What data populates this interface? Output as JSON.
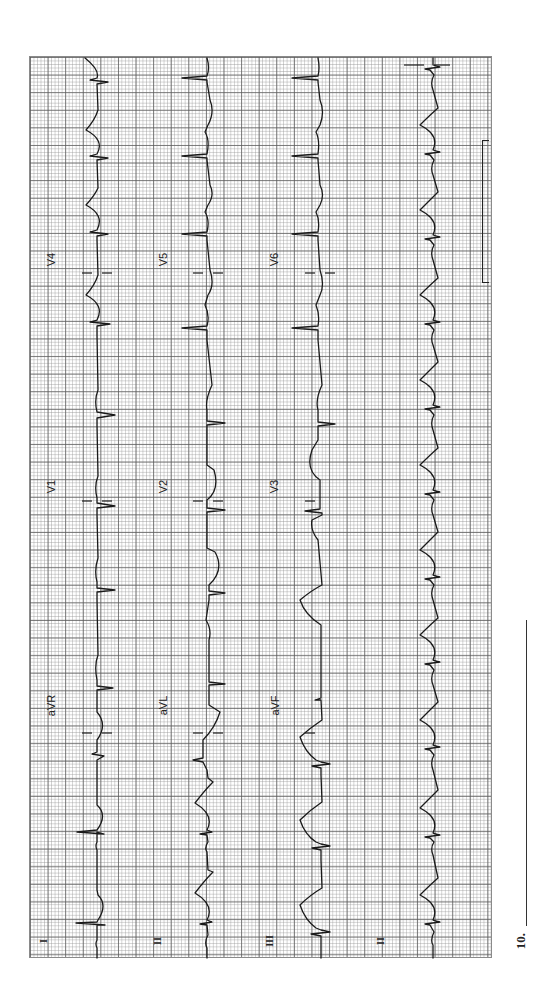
{
  "figure": {
    "type": "12-lead ECG tracing (rotated 90 degrees)",
    "question_number": "10.",
    "answer_line": ""
  },
  "colors": {
    "paper": "#ffffff",
    "grid_major": "#5a5a5a",
    "grid_minor": "#969696",
    "trace": "#1a1a1a"
  },
  "rows": [
    {
      "row": 1,
      "leads": [
        "I",
        "aVR",
        "V1",
        "V4"
      ]
    },
    {
      "row": 2,
      "leads": [
        "II",
        "aVL",
        "V2",
        "V5"
      ]
    },
    {
      "row": 3,
      "leads": [
        "III",
        "aVF",
        "V3",
        "V6"
      ]
    },
    {
      "row": 4,
      "leads": [
        "II"
      ],
      "note": "rhythm strip"
    }
  ],
  "labels": {
    "r1c1": "I",
    "r1c2": "aVR",
    "r1c3": "V1",
    "r1c4": "V4",
    "r2c1": "II",
    "r2c2": "aVL",
    "r2c3": "V2",
    "r2c4": "V5",
    "r3c1": "III",
    "r3c2": "aVF",
    "r3c3": "V3",
    "r3c4": "V6",
    "r4c1": "II"
  },
  "calibration": {
    "shape": "bracket",
    "description": "standard calibration pulse"
  }
}
